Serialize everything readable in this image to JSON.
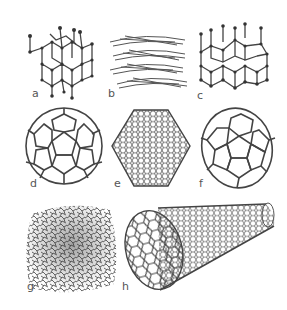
{
  "figure": {
    "panels": [
      {
        "id": "a",
        "label": "a",
        "name": "diamond"
      },
      {
        "id": "b",
        "label": "b",
        "name": "graphite"
      },
      {
        "id": "c",
        "label": "c",
        "name": "lonsdaleite"
      },
      {
        "id": "d",
        "label": "d",
        "name": "C60 buckminsterfullerene"
      },
      {
        "id": "e",
        "label": "e",
        "name": "C540 fullerene"
      },
      {
        "id": "f",
        "label": "f",
        "name": "C70 fullerene"
      },
      {
        "id": "g",
        "label": "g",
        "name": "amorphous carbon"
      },
      {
        "id": "h",
        "label": "h",
        "name": "single-walled carbon nanotube"
      }
    ],
    "colors": {
      "line": "#444444",
      "node": "#333333",
      "background": "#ffffff"
    }
  }
}
